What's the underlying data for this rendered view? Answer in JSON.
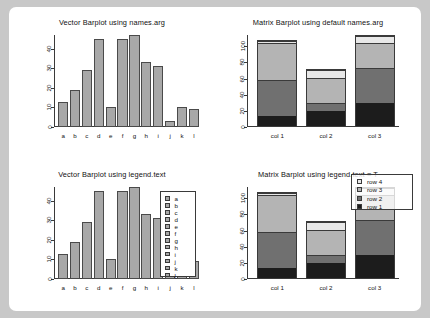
{
  "chart_data": [
    {
      "id": "vector-names",
      "type": "bar",
      "title": "Vector Barplot using names.arg",
      "categories": [
        "a",
        "b",
        "c",
        "d",
        "e",
        "f",
        "g",
        "h",
        "i",
        "j",
        "k",
        "l"
      ],
      "values": [
        13,
        19,
        29,
        45,
        10,
        45,
        47,
        33,
        31,
        3,
        10,
        9
      ],
      "xlabel": "",
      "ylabel": "",
      "ylim": [
        0,
        47
      ],
      "yticks": [
        0,
        10,
        20,
        30,
        40
      ],
      "grid": false,
      "legend": null,
      "bar_color": "#a8a8a8"
    },
    {
      "id": "matrix-default",
      "type": "bar",
      "subtype": "stacked",
      "title": "Matrix Barplot using default names.arg",
      "categories": [
        "col 1",
        "col 2",
        "col 3"
      ],
      "series": [
        {
          "name": "row 1",
          "values": [
            13,
            19,
            29
          ],
          "color": "#1c1c1c"
        },
        {
          "name": "row 2",
          "values": [
            45,
            10,
            45
          ],
          "color": "#707070"
        },
        {
          "name": "row 3",
          "values": [
            47,
            33,
            31
          ],
          "color": "#b4b4b4"
        },
        {
          "name": "row 4",
          "values": [
            3,
            10,
            9
          ],
          "color": "#e8e8e8"
        }
      ],
      "totals": [
        108,
        72,
        114
      ],
      "xlabel": "",
      "ylabel": "",
      "ylim": [
        0,
        114
      ],
      "yticks": [
        0,
        20,
        40,
        60,
        80,
        100
      ],
      "grid": false,
      "legend": null
    },
    {
      "id": "vector-legend",
      "type": "bar",
      "title": "Vector Barplot using legend.text",
      "categories": [
        "a",
        "b",
        "c",
        "d",
        "e",
        "f",
        "g",
        "h",
        "i",
        "j",
        "k",
        "l"
      ],
      "values": [
        13,
        19,
        29,
        45,
        10,
        45,
        47,
        33,
        31,
        3,
        10,
        9
      ],
      "xlabel": "",
      "ylabel": "",
      "ylim": [
        0,
        47
      ],
      "yticks": [
        0,
        10,
        20,
        30,
        40
      ],
      "grid": false,
      "bar_color": "#a8a8a8",
      "legend": {
        "position": "right",
        "entries": [
          "a",
          "b",
          "c",
          "d",
          "e",
          "f",
          "g",
          "h",
          "i",
          "j",
          "k",
          "l"
        ]
      }
    },
    {
      "id": "matrix-legend",
      "type": "bar",
      "subtype": "stacked",
      "title": "Matrix Barplot using legend.text = T",
      "categories": [
        "col 1",
        "col 2",
        "col 3"
      ],
      "series": [
        {
          "name": "row 1",
          "values": [
            13,
            19,
            29
          ],
          "color": "#1c1c1c"
        },
        {
          "name": "row 2",
          "values": [
            45,
            10,
            45
          ],
          "color": "#707070"
        },
        {
          "name": "row 3",
          "values": [
            47,
            33,
            31
          ],
          "color": "#b4b4b4"
        },
        {
          "name": "row 4",
          "values": [
            3,
            10,
            9
          ],
          "color": "#e8e8e8"
        }
      ],
      "totals": [
        108,
        72,
        114
      ],
      "xlabel": "",
      "ylabel": "",
      "ylim": [
        0,
        114
      ],
      "yticks": [
        0,
        20,
        40,
        60,
        80,
        100
      ],
      "grid": false,
      "legend": {
        "position": "top-right",
        "entries": [
          "row 4",
          "row 3",
          "row 2",
          "row 1"
        ],
        "colors": [
          "#e8e8e8",
          "#b4b4b4",
          "#707070",
          "#1c1c1c"
        ]
      }
    }
  ],
  "colors": {
    "page_background": "#ffffff",
    "canvas_background": "#c8c8c8",
    "axis": "#3a3a3a",
    "bar_gray": "#a8a8a8",
    "text": "#111111"
  }
}
